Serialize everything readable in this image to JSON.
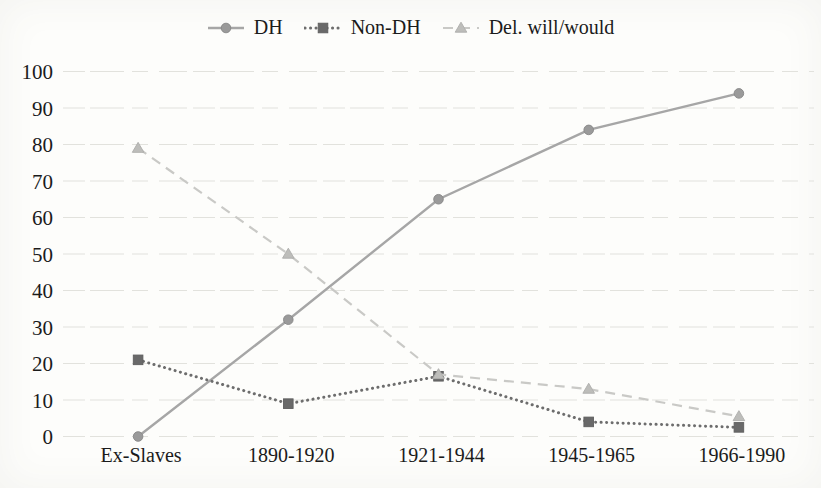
{
  "figure": {
    "background": "#fdfdfb",
    "text_color": "#1b1b1b",
    "gridline_color": "#e2e2dd"
  },
  "chart_data": {
    "type": "line",
    "title": "",
    "xlabel": "",
    "ylabel": "",
    "categories": [
      "Ex-Slaves",
      "1890-1920",
      "1921-1944",
      "1945-1965",
      "1966-1990"
    ],
    "series": [
      {
        "name": "DH",
        "values": [
          0,
          32,
          65,
          84,
          94
        ],
        "color": "#a6a6a6",
        "marker": "circle",
        "marker_color": "#9a9a9a",
        "marker_edge": "#878787",
        "line_style": "solid"
      },
      {
        "name": "Non-DH",
        "values": [
          21,
          9,
          16.5,
          4,
          2.5
        ],
        "color": "#6d6d6d",
        "marker": "square",
        "marker_color": "#696969",
        "marker_edge": "#5e5e5e",
        "line_style": "dotted"
      },
      {
        "name": "Del. will/would",
        "values": [
          79,
          50,
          17,
          13,
          5.5
        ],
        "color": "#c9c9c6",
        "marker": "triangle",
        "marker_color": "#bdbdba",
        "marker_edge": "#aeaeab",
        "line_style": "dashed"
      }
    ],
    "ylim": [
      0,
      100
    ],
    "yticks": [
      0,
      10,
      20,
      30,
      40,
      50,
      60,
      70,
      80,
      90,
      100
    ],
    "grid": "horizontal",
    "legend_position": "top"
  }
}
